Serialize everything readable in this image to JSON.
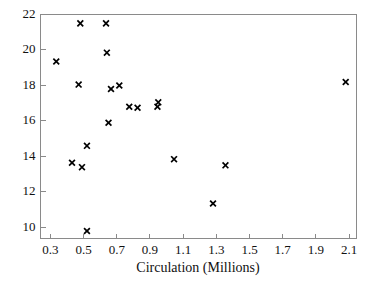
{
  "chart_data": {
    "type": "scatter",
    "title": "",
    "xlabel": "Circulation (Millions)",
    "ylabel": "",
    "xlim": [
      0.24,
      2.145
    ],
    "ylim": [
      9.38,
      22.0
    ],
    "grid": false,
    "legend": null,
    "marker": "x",
    "marker_color": "#000000",
    "xticks": [
      0.3,
      0.5,
      0.7,
      0.9,
      1.1,
      1.3,
      1.5,
      1.7,
      1.9,
      2.1
    ],
    "xticklabels": [
      "0.3",
      "0.5",
      "0.7",
      "0.9",
      "1.1",
      "1.3",
      "1.5",
      "1.7",
      "1.9",
      "2.1"
    ],
    "yticks": [
      10,
      12,
      14,
      16,
      18,
      20,
      22
    ],
    "yticklabels": [
      "10",
      "12",
      "14",
      "16",
      "18",
      "20",
      "22"
    ],
    "points": [
      {
        "x": 0.335,
        "y": 19.35
      },
      {
        "x": 0.43,
        "y": 13.65
      },
      {
        "x": 0.47,
        "y": 18.05
      },
      {
        "x": 0.48,
        "y": 21.5
      },
      {
        "x": 0.49,
        "y": 13.4
      },
      {
        "x": 0.52,
        "y": 14.6
      },
      {
        "x": 0.52,
        "y": 9.8
      },
      {
        "x": 0.635,
        "y": 21.5
      },
      {
        "x": 0.64,
        "y": 19.85
      },
      {
        "x": 0.65,
        "y": 15.9
      },
      {
        "x": 0.665,
        "y": 17.8
      },
      {
        "x": 0.715,
        "y": 18.0
      },
      {
        "x": 0.775,
        "y": 16.8
      },
      {
        "x": 0.825,
        "y": 16.75
      },
      {
        "x": 0.945,
        "y": 16.8
      },
      {
        "x": 0.95,
        "y": 17.05
      },
      {
        "x": 1.045,
        "y": 13.85
      },
      {
        "x": 1.28,
        "y": 11.35
      },
      {
        "x": 1.355,
        "y": 13.5
      },
      {
        "x": 2.08,
        "y": 18.2
      }
    ]
  },
  "axes": {
    "frame_color": "#8a8a8a",
    "background": "#ffffff"
  }
}
